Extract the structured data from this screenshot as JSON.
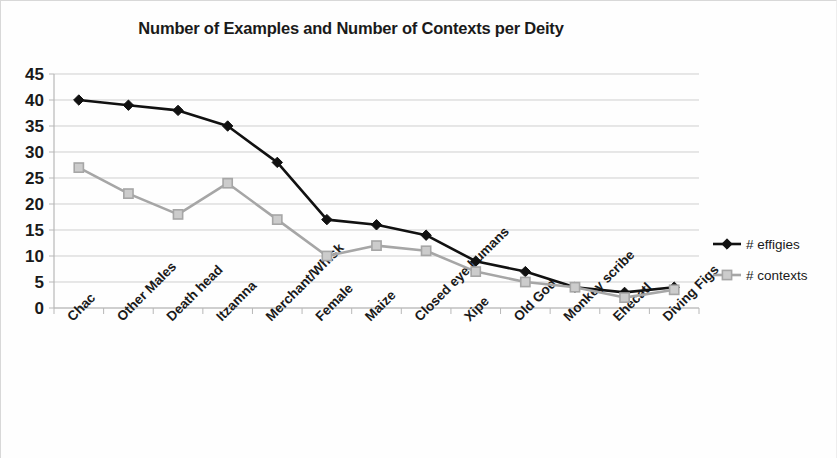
{
  "chart_data": {
    "type": "line",
    "title": "Number of Examples and Number of Contexts per Deity",
    "xlabel": "",
    "ylabel": "",
    "ylim": [
      0,
      45
    ],
    "ytick_step": 5,
    "yticks": [
      "0",
      "5",
      "10",
      "15",
      "20",
      "25",
      "30",
      "35",
      "40",
      "45"
    ],
    "grid": true,
    "legend_position": "right",
    "categories": [
      "Chac",
      "Other Males",
      "Death head",
      "Itzamna",
      "Merchant/Whisk",
      "Female",
      "Maize",
      "Closed eye humans",
      "Xipe",
      "Old God",
      "Monkey scribe",
      "Ehecatl",
      "Diving Figs"
    ],
    "series": [
      {
        "name": "# effigies",
        "color": "#111111",
        "marker": "diamond",
        "values": [
          40,
          39,
          38,
          35,
          28,
          17,
          16,
          14,
          9,
          7,
          4,
          3,
          4
        ]
      },
      {
        "name": "# contexts",
        "color": "#a6a6a6",
        "marker": "square",
        "values": [
          27,
          22,
          18,
          24,
          17,
          10,
          12,
          11,
          7,
          5,
          4,
          2,
          3.5
        ]
      }
    ]
  },
  "legend": {
    "items": [
      {
        "label": "# effigies",
        "marker": "diamond-marker-icon"
      },
      {
        "label": "# contexts",
        "marker": "square-marker-icon"
      }
    ]
  }
}
